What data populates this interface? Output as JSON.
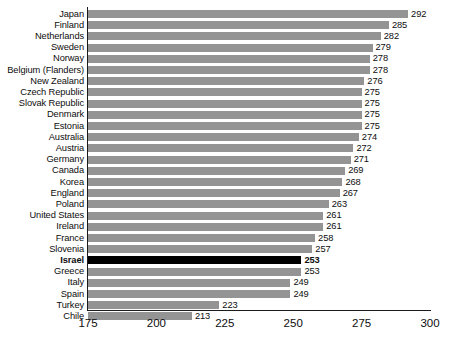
{
  "chart_data": {
    "type": "bar",
    "orientation": "horizontal",
    "title": "",
    "subtitle": "",
    "xlabel": "",
    "ylabel": "",
    "xlim": [
      175,
      300
    ],
    "xticks": [
      175,
      200,
      225,
      250,
      275,
      300
    ],
    "grid": false,
    "legend": null,
    "bar_color": "#949494",
    "highlight_color": "#000000",
    "highlight_category": "Israel",
    "axis_color": "#1a1a1a",
    "categories": [
      "Japan",
      "Finland",
      "Netherlands",
      "Sweden",
      "Norway",
      "Belgium (Flanders)",
      "New Zealand",
      "Czech Republic",
      "Slovak Republic",
      "Denmark",
      "Estonia",
      "Australia",
      "Austria",
      "Germany",
      "Canada",
      "Korea",
      "England",
      "Poland",
      "United States",
      "Ireland",
      "France",
      "Slovenia",
      "Israel",
      "Greece",
      "Italy",
      "Spain",
      "Turkey",
      "Chile"
    ],
    "values": [
      292,
      285,
      282,
      279,
      278,
      278,
      276,
      275,
      275,
      275,
      275,
      274,
      272,
      271,
      269,
      268,
      267,
      263,
      261,
      261,
      258,
      257,
      253,
      253,
      249,
      249,
      223,
      213
    ],
    "value_labels": [
      "292",
      "285",
      "282",
      "279",
      "278",
      "278",
      "276",
      "275",
      "275",
      "275",
      "275",
      "274",
      "272",
      "271",
      "269",
      "268",
      "267",
      "263",
      "261",
      "261",
      "258",
      "257",
      "253",
      "253",
      "249",
      "249",
      "223",
      "213"
    ],
    "xtick_labels": [
      "175",
      "200",
      "225",
      "250",
      "275",
      "300"
    ]
  }
}
